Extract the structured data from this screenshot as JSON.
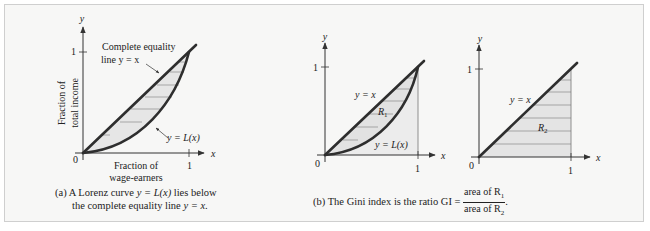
{
  "figure": {
    "panel_a": {
      "axis_x_label": "x",
      "axis_y_label": "y",
      "tick_zero": "0",
      "tick_x_one": "1",
      "tick_y_one": "1",
      "y_title_line1": "Fraction of",
      "y_title_line2": "total income",
      "x_title_line1": "Fraction of",
      "x_title_line2": "wage-earners",
      "equality_label_line1": "Complete equality",
      "equality_label_line2": "line y = x",
      "curve_label": "y = L(x)",
      "caption_prefix": "(a)",
      "caption_line1_a": "A Lorenz curve ",
      "caption_line1_math": "y = L(x)",
      "caption_line1_b": " lies below",
      "caption_line2_a": "the complete equality line ",
      "caption_line2_math": "y = x",
      "caption_line2_b": "."
    },
    "panel_b": {
      "axis_x_label": "x",
      "axis_y_label": "y",
      "tick_zero": "0",
      "tick_x_one": "1",
      "tick_y_one": "1",
      "line_label": "y = x",
      "region_label": "R",
      "region_sub": "1",
      "curve_label": "y = L(x)"
    },
    "panel_c": {
      "axis_x_label": "x",
      "axis_y_label": "y",
      "tick_zero": "0",
      "tick_x_one": "1",
      "tick_y_one": "1",
      "line_label": "y = x",
      "region_label": "R",
      "region_sub": "2"
    },
    "caption_b": {
      "prefix": "(b)",
      "text": "The Gini index is the ratio GI = ",
      "num": "area of R",
      "num_sub": "1",
      "den": "area of R",
      "den_sub": "2",
      "suffix": "."
    },
    "colors": {
      "background": "#f7f7f6",
      "border": "#cfcfcf",
      "curve": "#2e2e2e",
      "shade": "#e6e6e6",
      "hatch": "#8a8a8a",
      "axis": "#333333"
    }
  }
}
